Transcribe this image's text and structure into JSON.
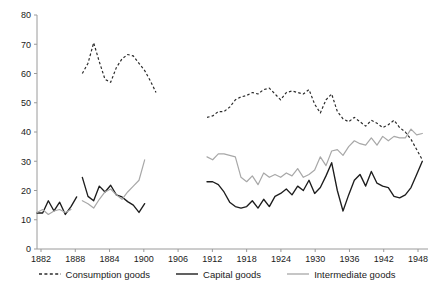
{
  "chart_data": {
    "type": "line",
    "title": "",
    "xlabel": "",
    "ylabel": "",
    "xlim": [
      1882,
      1951
    ],
    "ylim": [
      0,
      80
    ],
    "grid": false,
    "legend_position": "bottom",
    "y_ticks": [
      0,
      10,
      20,
      30,
      40,
      50,
      60,
      70,
      80
    ],
    "x_ticks": [
      1882,
      1888,
      1884,
      1900,
      1906,
      1912,
      1918,
      1924,
      1930,
      1936,
      1942,
      1948
    ],
    "series": [
      {
        "name": "Consumption goods",
        "style": "dashed",
        "color": "#2b2b2b",
        "segments": [
          {
            "x": [
              1890,
              1891,
              1892,
              1893,
              1894,
              1895,
              1896,
              1897,
              1898,
              1899,
              1900,
              1901,
              1902,
              1903
            ],
            "y": [
              60.0,
              63.5,
              70.5,
              64.0,
              58.0,
              57.0,
              62.0,
              65.0,
              66.5,
              66.0,
              63.5,
              61.0,
              57.5,
              53.5
            ]
          },
          {
            "x": [
              1912,
              1913,
              1914,
              1915,
              1916,
              1917,
              1918,
              1919,
              1920,
              1921,
              1922,
              1923,
              1924,
              1925,
              1926,
              1927,
              1928,
              1929,
              1930,
              1931,
              1932,
              1933,
              1934,
              1935,
              1936,
              1937,
              1938,
              1939,
              1940,
              1941,
              1942,
              1943,
              1944,
              1945,
              1946,
              1947,
              1948,
              1949,
              1950
            ],
            "y": [
              45.0,
              45.5,
              47.0,
              47.0,
              48.5,
              51.0,
              52.0,
              52.5,
              53.5,
              53.0,
              54.5,
              55.0,
              53.0,
              51.0,
              53.5,
              54.0,
              53.5,
              53.0,
              54.5,
              49.5,
              46.5,
              51.0,
              53.0,
              47.0,
              44.5,
              43.5,
              45.0,
              43.5,
              42.0,
              44.0,
              43.0,
              41.5,
              42.5,
              44.0,
              41.5,
              40.0,
              37.5,
              34.0,
              30.5
            ]
          }
        ]
      },
      {
        "name": "Capital goods",
        "style": "solid",
        "color": "#1d1d1d",
        "segments": [
          {
            "x": [
              1882,
              1883,
              1884,
              1885,
              1886,
              1887,
              1888,
              1889
            ],
            "y": [
              12.3,
              12.3,
              16.5,
              13.0,
              16.0,
              11.8,
              14.5,
              17.8
            ]
          },
          {
            "x": [
              1890,
              1891,
              1892,
              1893,
              1894,
              1895,
              1896,
              1897,
              1898,
              1899,
              1900,
              1901
            ],
            "y": [
              24.5,
              18.0,
              16.5,
              21.5,
              19.5,
              21.8,
              18.5,
              17.8,
              16.2,
              15.0,
              12.5,
              15.5
            ]
          },
          {
            "x": [
              1912,
              1913,
              1914,
              1915,
              1916,
              1917,
              1918,
              1919,
              1920,
              1921,
              1922,
              1923,
              1924,
              1925,
              1926,
              1927,
              1928,
              1929,
              1930,
              1931,
              1932,
              1933,
              1934,
              1935,
              1936,
              1937,
              1938,
              1939,
              1940,
              1941,
              1942,
              1943,
              1944,
              1945,
              1946,
              1947,
              1948,
              1949,
              1950
            ],
            "y": [
              23.0,
              23.0,
              22.0,
              19.5,
              16.0,
              14.5,
              14.0,
              14.5,
              16.5,
              14.0,
              17.0,
              14.5,
              18.0,
              19.0,
              20.5,
              18.5,
              21.5,
              20.0,
              23.5,
              19.0,
              21.0,
              25.0,
              29.5,
              20.0,
              13.0,
              18.5,
              23.5,
              25.5,
              21.5,
              26.5,
              22.5,
              21.5,
              21.0,
              18.0,
              17.5,
              18.5,
              21.0,
              25.5,
              30.0
            ]
          }
        ]
      },
      {
        "name": "Intermediate goods",
        "style": "solid-light",
        "color": "#a8a8a8",
        "segments": [
          {
            "x": [
              1882,
              1883,
              1884,
              1885,
              1886,
              1887,
              1888
            ],
            "y": [
              12.5,
              13.5,
              11.8,
              13.0,
              13.5,
              12.5,
              13.5
            ]
          },
          {
            "x": [
              1890,
              1891,
              1892,
              1893,
              1894,
              1895,
              1896,
              1897,
              1898,
              1899,
              1900,
              1901
            ],
            "y": [
              16.5,
              15.5,
              14.0,
              17.0,
              19.5,
              20.5,
              18.5,
              17.0,
              19.5,
              21.5,
              23.5,
              30.5
            ]
          },
          {
            "x": [
              1912,
              1913,
              1914,
              1915,
              1916,
              1917,
              1918,
              1919,
              1920,
              1921,
              1922,
              1923,
              1924,
              1925,
              1926,
              1927,
              1928,
              1929,
              1930,
              1931,
              1932,
              1933,
              1934,
              1935,
              1936,
              1937,
              1938,
              1939,
              1940,
              1941,
              1942,
              1943,
              1944,
              1945,
              1946,
              1947,
              1948,
              1949,
              1950
            ],
            "y": [
              31.5,
              30.5,
              32.5,
              32.5,
              32.0,
              31.5,
              24.5,
              23.0,
              25.0,
              22.0,
              26.0,
              24.5,
              25.5,
              24.5,
              26.0,
              25.0,
              27.5,
              24.5,
              25.5,
              27.0,
              31.5,
              28.5,
              33.5,
              34.0,
              32.0,
              35.0,
              37.0,
              36.0,
              35.5,
              38.0,
              35.5,
              38.5,
              37.0,
              38.5,
              38.0,
              38.0,
              41.0,
              39.0,
              39.5
            ]
          }
        ]
      }
    ],
    "legend": [
      {
        "label": "Consumption goods",
        "style": "dashed",
        "color": "#2b2b2b"
      },
      {
        "label": "Capital goods",
        "style": "solid",
        "color": "#1d1d1d"
      },
      {
        "label": "Intermediate goods",
        "style": "solid-light",
        "color": "#a8a8a8"
      }
    ]
  }
}
